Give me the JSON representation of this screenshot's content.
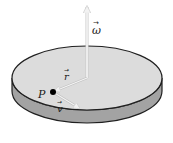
{
  "diagram": {
    "type": "rotating-disk",
    "labels": {
      "omega": "ω",
      "r": "r",
      "v": "v",
      "point": "P"
    },
    "colors": {
      "disk_top": "#dcdcdc",
      "disk_side": "#a3a3a3",
      "outline": "#1f1f1f",
      "vector": "#f4f4f4",
      "point": "#000000",
      "background": "#ffffff"
    }
  }
}
